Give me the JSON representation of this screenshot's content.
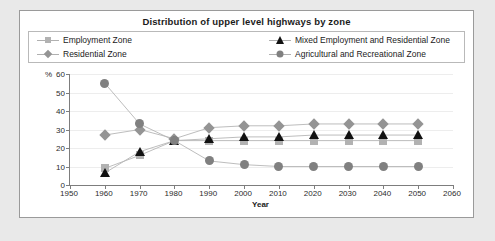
{
  "chart": {
    "title": "Distribution of upper level highways by zone",
    "y_unit_label": "%",
    "xlabel": "Year"
  },
  "legend": {
    "items": [
      {
        "label": "Employment Zone",
        "marker": "square",
        "color": "#b2b2b2",
        "has_line": false
      },
      {
        "label": "Residential Zone",
        "marker": "diamond",
        "color": "#949494",
        "has_line": false
      },
      {
        "label": "Mixed Employment and Residential Zone",
        "marker": "triangle",
        "color": "#111111",
        "has_line": true
      },
      {
        "label": "Agricultural and Recreational Zone",
        "marker": "circle",
        "color": "#808080",
        "has_line": true
      }
    ]
  },
  "chart_data": {
    "type": "line",
    "title": "Distribution of upper level highways by zone",
    "xlabel": "Year",
    "ylabel": "%",
    "xlim": [
      1950,
      2060
    ],
    "ylim": [
      0,
      60
    ],
    "xticks": [
      1950,
      1960,
      1970,
      1980,
      1990,
      2000,
      2010,
      2020,
      2030,
      2040,
      2050,
      2060
    ],
    "yticks": [
      0,
      10,
      20,
      30,
      40,
      50,
      60
    ],
    "grid": true,
    "legend_position": "top",
    "x": [
      1960,
      1970,
      1980,
      1990,
      2000,
      2010,
      2020,
      2030,
      2040,
      2050
    ],
    "series": [
      {
        "name": "Employment Zone",
        "marker": "square",
        "color": "#b2b2b2",
        "values": [
          9,
          16,
          24,
          24,
          24,
          24,
          24,
          24,
          24,
          24
        ]
      },
      {
        "name": "Residential Zone",
        "marker": "diamond",
        "color": "#949494",
        "values": [
          27,
          30,
          25,
          31,
          32,
          32,
          33,
          33,
          33,
          33
        ]
      },
      {
        "name": "Mixed Employment and Residential Zone",
        "marker": "triangle",
        "color": "#111111",
        "values": [
          6.5,
          18,
          24,
          25,
          26,
          26,
          27,
          27,
          27,
          27
        ]
      },
      {
        "name": "Agricultural and Recreational Zone",
        "marker": "circle",
        "color": "#808080",
        "values": [
          55,
          33,
          24,
          13,
          11,
          10,
          10,
          10,
          10,
          10
        ]
      }
    ]
  }
}
